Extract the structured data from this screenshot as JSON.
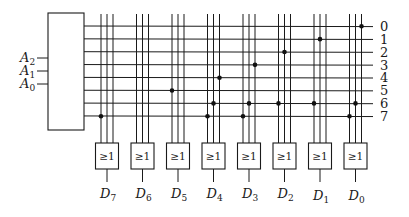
{
  "diagram": {
    "type": "decoder-or-rom",
    "decoder": {
      "inputs": [
        {
          "name": "A",
          "sub": "2"
        },
        {
          "name": "A",
          "sub": "1"
        },
        {
          "name": "A",
          "sub": "0"
        }
      ]
    },
    "row_labels": [
      "0",
      "1",
      "2",
      "3",
      "4",
      "5",
      "6",
      "7"
    ],
    "gate_symbol": "≥1",
    "outputs": [
      {
        "name": "D",
        "sub": "7",
        "dots": [
          {
            "line": 0,
            "row": 7
          }
        ]
      },
      {
        "name": "D",
        "sub": "6",
        "dots": []
      },
      {
        "name": "D",
        "sub": "5",
        "dots": [
          {
            "line": 0,
            "row": 5
          }
        ]
      },
      {
        "name": "D",
        "sub": "4",
        "dots": [
          {
            "line": 0,
            "row": 7
          },
          {
            "line": 1,
            "row": 6
          },
          {
            "line": 2,
            "row": 4
          }
        ]
      },
      {
        "name": "D",
        "sub": "3",
        "dots": [
          {
            "line": 0,
            "row": 7
          },
          {
            "line": 1,
            "row": 6
          },
          {
            "line": 2,
            "row": 3
          }
        ]
      },
      {
        "name": "D",
        "sub": "2",
        "dots": [
          {
            "line": 0,
            "row": 6
          },
          {
            "line": 1,
            "row": 2
          }
        ]
      },
      {
        "name": "D",
        "sub": "1",
        "dots": [
          {
            "line": 0,
            "row": 6
          },
          {
            "line": 1,
            "row": 1
          }
        ]
      },
      {
        "name": "D",
        "sub": "0",
        "dots": [
          {
            "line": 0,
            "row": 7
          },
          {
            "line": 1,
            "row": 6
          },
          {
            "line": 2,
            "row": 0
          }
        ]
      }
    ]
  }
}
